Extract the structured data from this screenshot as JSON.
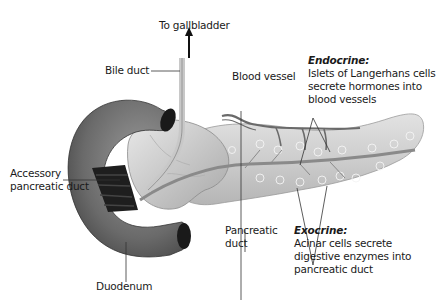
{
  "diagram": {
    "labels": {
      "to_gallbladder": "To gallbladder",
      "bile_duct": "Bile duct",
      "blood_vessel": "Blood vessel",
      "accessory_duct_line1": "Accessory",
      "accessory_duct_line2": "pancreatic duct",
      "pancreatic_duct_line1": "Pancreatic",
      "pancreatic_duct_line2": "duct",
      "duodenum": "Duodenum"
    },
    "endocrine": {
      "title": "Endocrine:",
      "line1": "Islets of Langerhans cells",
      "line2": "secrete hormones into",
      "line3": "blood vessels"
    },
    "exocrine": {
      "title": "Exocrine:",
      "line1": "Acinar cells secrete",
      "line2": "digestive enzymes into",
      "line3": "pancreatic duct"
    },
    "colors": {
      "background": "#ffffff",
      "text": "#1a1a1a",
      "duodenum": "#6e6e6e",
      "pancreas": "#cfcfcf",
      "vessel": "#555555"
    }
  }
}
